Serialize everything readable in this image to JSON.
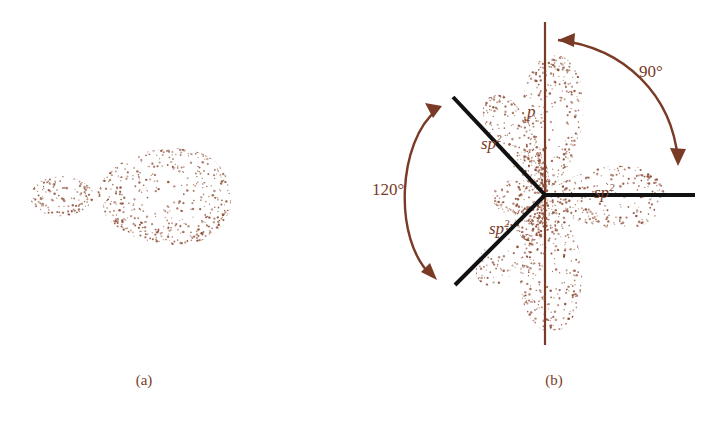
{
  "figure": {
    "stipple_color": "#8a4a32",
    "line_color": "#7a3b26",
    "bond_color": "#111111",
    "background": "#ffffff"
  },
  "panels": [
    {
      "id": "a",
      "caption": "(a)",
      "description": "single sp2 hybrid orbital"
    },
    {
      "id": "b",
      "caption": "(b)",
      "description": "three sp2 hybrid orbitals plus perpendicular p orbital"
    }
  ],
  "labels": {
    "sp2_upper_left": "sp",
    "sp2_upper_left_sup": "2",
    "sp2_lower_left": "sp",
    "sp2_lower_left_sup": "2",
    "sp2_right": "sp",
    "sp2_right_sup": "2",
    "p_orbital": "p"
  },
  "angles": {
    "p_to_sp2": "90°",
    "sp2_to_sp2": "120°"
  },
  "chart_data": {
    "type": "diagram",
    "panel_a": {
      "caption": "(a)",
      "orbital": "sp2 hybrid",
      "lobes": [
        {
          "name": "back-lobe",
          "size": "small",
          "direction": "left"
        },
        {
          "name": "front-lobe",
          "size": "large",
          "direction": "right"
        }
      ],
      "center": [
        95,
        196
      ],
      "orientation_deg": 0
    },
    "panel_b": {
      "caption": "(b)",
      "center": [
        545,
        195
      ],
      "orbitals": [
        {
          "name": "sp2",
          "label": "sp2",
          "angle_deg": 150,
          "type": "hybrid"
        },
        {
          "name": "sp2",
          "label": "sp2",
          "angle_deg": 210,
          "type": "hybrid"
        },
        {
          "name": "sp2",
          "label": "sp2",
          "angle_deg": 0,
          "type": "hybrid"
        },
        {
          "name": "p",
          "label": "p",
          "angle_deg": 90,
          "type": "unhybridized",
          "lobes": 2
        }
      ],
      "angle_annotations": [
        {
          "label": "90°",
          "between": [
            "p",
            "sp2-right"
          ]
        },
        {
          "label": "120°",
          "between": [
            "sp2-upper-left",
            "sp2-lower-left"
          ]
        }
      ],
      "bond_lines_deg": [
        150,
        210,
        0
      ],
      "axis_line_deg": 90
    }
  }
}
